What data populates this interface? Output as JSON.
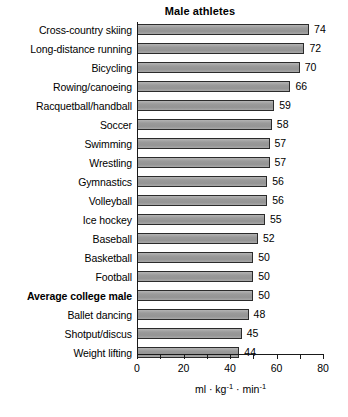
{
  "chart_data": {
    "type": "bar",
    "orientation": "horizontal",
    "title": "Male athletes",
    "xlabel": "ml · kg-1 · min-1",
    "ylabel": "",
    "xlim": [
      0,
      80
    ],
    "xticks": [
      0,
      10,
      20,
      30,
      40,
      50,
      60,
      70,
      80
    ],
    "xtick_labels": [
      "0",
      "",
      "20",
      "",
      "40",
      "",
      "60",
      "",
      "80"
    ],
    "grid": false,
    "legend": null,
    "categories": [
      "Cross-country skiing",
      "Long-distance running",
      "Bicycling",
      "Rowing/canoeing",
      "Racquetball/handball",
      "Soccer",
      "Swimming",
      "Wrestling",
      "Gymnastics",
      "Volleyball",
      "Ice hockey",
      "Baseball",
      "Basketball",
      "Football",
      "Average college male",
      "Ballet dancing",
      "Shotput/discus",
      "Weight lifting"
    ],
    "values": [
      74,
      72,
      70,
      66,
      59,
      58,
      57,
      57,
      56,
      56,
      55,
      52,
      50,
      50,
      50,
      48,
      45,
      44
    ],
    "value_labels": [
      "74",
      "72",
      "70",
      "66",
      "59",
      "58",
      "57",
      "57",
      "56",
      "56",
      "55",
      "52",
      "50",
      "50",
      "50",
      "48",
      "45",
      "44"
    ],
    "highlighted_category": "Average college male",
    "bar_fill_color": "#9a9a9a",
    "bar_border_color": "#2b2b2b",
    "axis_color": "#1a1a1a",
    "background_color": "#ffffff"
  },
  "axis_title_parts": {
    "ml": "ml",
    "dot1": "·",
    "kg": "kg",
    "kg_exp": "-1",
    "dot2": "·",
    "min": "min",
    "min_exp": "-1"
  }
}
